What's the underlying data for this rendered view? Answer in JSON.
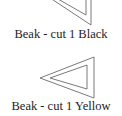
{
  "pieces": [
    {
      "label": "Beak - cut 1 Black",
      "shape": "beak-triangle"
    },
    {
      "label": "Beak - cut 1 Yellow",
      "shape": "beak-triangle"
    }
  ],
  "colors": {
    "outline": "#7a7a7a",
    "text": "#222222",
    "background": "#ffffff"
  }
}
